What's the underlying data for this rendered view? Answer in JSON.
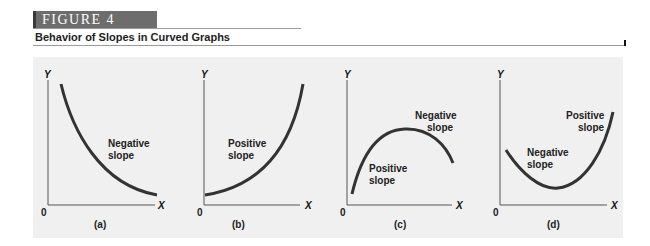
{
  "figure": {
    "label": "FIGURE 4",
    "title": "Behavior of Slopes in Curved Graphs"
  },
  "colors": {
    "banner_bg": "#6d6d6d",
    "panel_bg": "#f0f0f0",
    "curve": "#333333",
    "axis": "#555555"
  },
  "panels": [
    {
      "id": "a",
      "caption": "(a)",
      "y_axis": "Y",
      "x_axis": "X",
      "origin": "0",
      "shape": "decreasing convex curve",
      "labels": [
        {
          "line1": "Negative",
          "line2": "slope"
        }
      ]
    },
    {
      "id": "b",
      "caption": "(b)",
      "y_axis": "Y",
      "x_axis": "X",
      "origin": "0",
      "shape": "increasing convex curve",
      "labels": [
        {
          "line1": "Positive",
          "line2": "slope"
        }
      ]
    },
    {
      "id": "c",
      "caption": "(c)",
      "y_axis": "Y",
      "x_axis": "X",
      "origin": "0",
      "shape": "hill (rises then falls)",
      "labels": [
        {
          "line1": "Negative",
          "line2": "slope"
        },
        {
          "line1": "Positive",
          "line2": "slope"
        }
      ]
    },
    {
      "id": "d",
      "caption": "(d)",
      "y_axis": "Y",
      "x_axis": "X",
      "origin": "0",
      "shape": "valley (falls then rises)",
      "labels": [
        {
          "line1": "Positive",
          "line2": "slope"
        },
        {
          "line1": "Negative",
          "line2": "slope"
        }
      ]
    }
  ]
}
